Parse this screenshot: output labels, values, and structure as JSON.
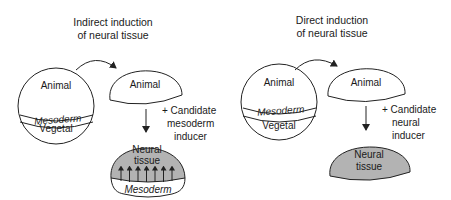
{
  "left_panel": {
    "title_line1": "Indirect induction",
    "title_line2": "of neural tissue",
    "embryo": {
      "top": "Animal",
      "middle": "Mesoderm",
      "bottom": "Vegetal"
    },
    "cap_label": "Animal",
    "treatment_line1": "+ Candidate",
    "treatment_line2": "mesoderm",
    "treatment_line3": "inducer",
    "result_line1": "Neural",
    "result_line2": "tissue",
    "result_base": "Mesoderm"
  },
  "right_panel": {
    "title_line1": "Direct induction",
    "title_line2": "of neural tissue",
    "embryo": {
      "top": "Animal",
      "middle": "Mesoderm",
      "bottom": "Vegetal"
    },
    "cap_label": "Animal",
    "treatment_line1": "+ Candidate",
    "treatment_line2": "neural",
    "treatment_line3": "inducer",
    "result_line1": "Neural",
    "result_line2": "tissue"
  },
  "colors": {
    "neural_fill": "#b3b3b3",
    "line": "#222222"
  }
}
